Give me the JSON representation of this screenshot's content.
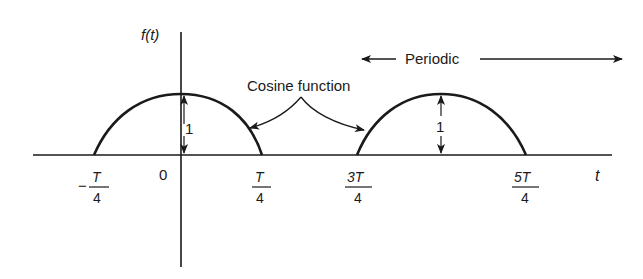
{
  "diagram": {
    "y_axis_label": "f(t)",
    "x_axis_label": "t",
    "origin_label": "0",
    "ticks": [
      {
        "id": "neg_t4",
        "sign": "−",
        "num": "T",
        "den": "4"
      },
      {
        "id": "t4",
        "sign": "",
        "num": "T",
        "den": "4"
      },
      {
        "id": "3t4",
        "sign": "",
        "num": "3T",
        "den": "4"
      },
      {
        "id": "5t4",
        "sign": "",
        "num": "5T",
        "den": "4"
      }
    ],
    "amplitude_labels": [
      "1",
      "1"
    ],
    "annotation": "Cosine function",
    "periodic_label": "Periodic",
    "colors": {
      "ink": "#1a1a1a",
      "background": "#ffffff"
    }
  }
}
